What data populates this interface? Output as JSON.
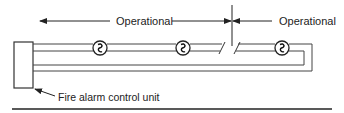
{
  "diagram": {
    "labels": {
      "left_span": "Operational",
      "right_span": "Operational",
      "control_unit": "Fire alarm control unit"
    },
    "components": {
      "control_unit": {
        "name": "Fire alarm control unit",
        "shape": "rectangle"
      },
      "devices": [
        {
          "id": "device-1",
          "symbol": "notification-appliance"
        },
        {
          "id": "device-2",
          "symbol": "notification-appliance"
        },
        {
          "id": "device-3",
          "symbol": "notification-appliance"
        }
      ],
      "break": {
        "symbol": "open-circuit-break",
        "position": "between device-2 and device-3"
      }
    },
    "colors": {
      "line": "#333333",
      "text": "#222222",
      "background": "#ffffff"
    }
  }
}
